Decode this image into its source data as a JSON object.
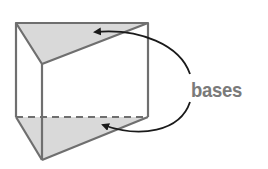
{
  "diagram": {
    "type": "triangular-prism",
    "label": "bases",
    "colors": {
      "edge": "#6f6f6f",
      "base_fill": "#d9d9d9",
      "arrow": "#1a1a1a",
      "label": "#7a7a7a"
    },
    "annotations": [
      {
        "text": "bases",
        "points_to": [
          "top-triangular-base",
          "bottom-triangular-base"
        ]
      }
    ]
  }
}
